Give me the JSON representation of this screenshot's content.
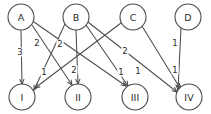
{
  "figure": {
    "width": 211,
    "height": 114,
    "background_color": "#ffffff",
    "stroke_color": "#4d4d4d",
    "text_color": "#2b2b2b"
  },
  "chart_data": {
    "type": "diagram",
    "diagram_kind": "bipartite-weighted-directed-graph",
    "title": "",
    "top_nodes": [
      {
        "id": "A",
        "label": "A",
        "cx": 21,
        "cy": 17,
        "r": 13
      },
      {
        "id": "B",
        "label": "B",
        "cx": 76,
        "cy": 17,
        "r": 13
      },
      {
        "id": "C",
        "label": "C",
        "cx": 133,
        "cy": 17,
        "r": 13
      },
      {
        "id": "D",
        "label": "D",
        "cx": 188,
        "cy": 17,
        "r": 13
      }
    ],
    "bottom_nodes": [
      {
        "id": "I",
        "label": "I",
        "cx": 22,
        "cy": 97,
        "r": 13
      },
      {
        "id": "II",
        "label": "II",
        "cx": 78,
        "cy": 97,
        "r": 13
      },
      {
        "id": "III",
        "label": "III",
        "cx": 135,
        "cy": 97,
        "r": 13
      },
      {
        "id": "IV",
        "label": "IV",
        "cx": 189,
        "cy": 97,
        "r": 13
      }
    ],
    "edges": [
      {
        "from": "A",
        "to": "I",
        "weight": "3",
        "x1": 21,
        "y1": 30,
        "x2": 22,
        "y2": 84,
        "lx": 20,
        "ly": 52,
        "arrow": true
      },
      {
        "from": "A",
        "to": "II",
        "weight": "2",
        "x1": 32,
        "y1": 25,
        "x2": 72,
        "y2": 85,
        "lx": 37,
        "ly": 43,
        "arrow": true
      },
      {
        "from": "A",
        "to": "III",
        "weight": "2",
        "x1": 34,
        "y1": 22,
        "x2": 126,
        "y2": 86,
        "lx": 60,
        "ly": 44,
        "arrow": true
      },
      {
        "from": "B",
        "to": "I",
        "weight": "1",
        "x1": 65,
        "y1": 24,
        "x2": 34,
        "y2": 90,
        "lx": 44,
        "ly": 72,
        "arrow": true
      },
      {
        "from": "B",
        "to": "II",
        "weight": "2",
        "x1": 76,
        "y1": 30,
        "x2": 78,
        "y2": 84,
        "lx": 74,
        "ly": 70,
        "arrow": true
      },
      {
        "from": "B",
        "to": "III",
        "weight": "1",
        "x1": 86,
        "y1": 25,
        "x2": 128,
        "y2": 86,
        "lx": 121,
        "ly": 72,
        "arrow": true
      },
      {
        "from": "B",
        "to": "IV",
        "weight": "1",
        "x1": 88,
        "y1": 22,
        "x2": 177,
        "y2": 92,
        "lx": 138,
        "ly": 71,
        "arrow": true
      },
      {
        "from": "C",
        "to": "I",
        "weight": "2",
        "x1": 121,
        "y1": 23,
        "x2": 35,
        "y2": 88,
        "lx": 125,
        "ly": 51,
        "arrow": true
      },
      {
        "from": "C",
        "to": "IV",
        "weight": "1",
        "x1": 142,
        "y1": 26,
        "x2": 180,
        "y2": 88,
        "lx": 175,
        "ly": 70,
        "arrow": true
      },
      {
        "from": "D",
        "to": "IV",
        "weight": "1",
        "x1": 181,
        "y1": 28,
        "x2": 178,
        "y2": 90,
        "lx": 175,
        "ly": 43,
        "arrow": true
      }
    ],
    "weights_legend": [
      "1",
      "2",
      "3"
    ],
    "node_count": 8,
    "edge_count": 10
  }
}
